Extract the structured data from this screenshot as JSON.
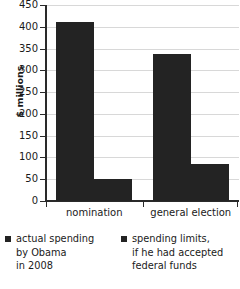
{
  "chart_data": {
    "type": "bar",
    "title": "",
    "xlabel": "",
    "ylabel": "$ millions",
    "categories": [
      "nomination",
      "general election"
    ],
    "series": [
      {
        "name": "actual spending by Obama in 2008",
        "values": [
          410,
          337
        ]
      },
      {
        "name": "spending limits, if he had accepted federal funds",
        "values": [
          50,
          85
        ]
      }
    ],
    "ylim": [
      0,
      450
    ],
    "yticks": [
      0,
      50,
      100,
      150,
      200,
      250,
      300,
      350,
      400,
      450
    ],
    "ytick_labels": [
      "0",
      "50",
      "100",
      "150",
      "200",
      "250",
      "300",
      "350",
      "400",
      "450"
    ],
    "grid": true,
    "legend_position": "bottom",
    "bar_color": "#232323",
    "gridline_color": "#d8d8d8",
    "axis_color": "#2a2a2a"
  },
  "legend": {
    "items": [
      {
        "line1": "actual spending",
        "line2": "by Obama",
        "line3": "in 2008"
      },
      {
        "line1": "spending limits,",
        "line2": "if he had accepted",
        "line3": "federal funds"
      }
    ]
  }
}
